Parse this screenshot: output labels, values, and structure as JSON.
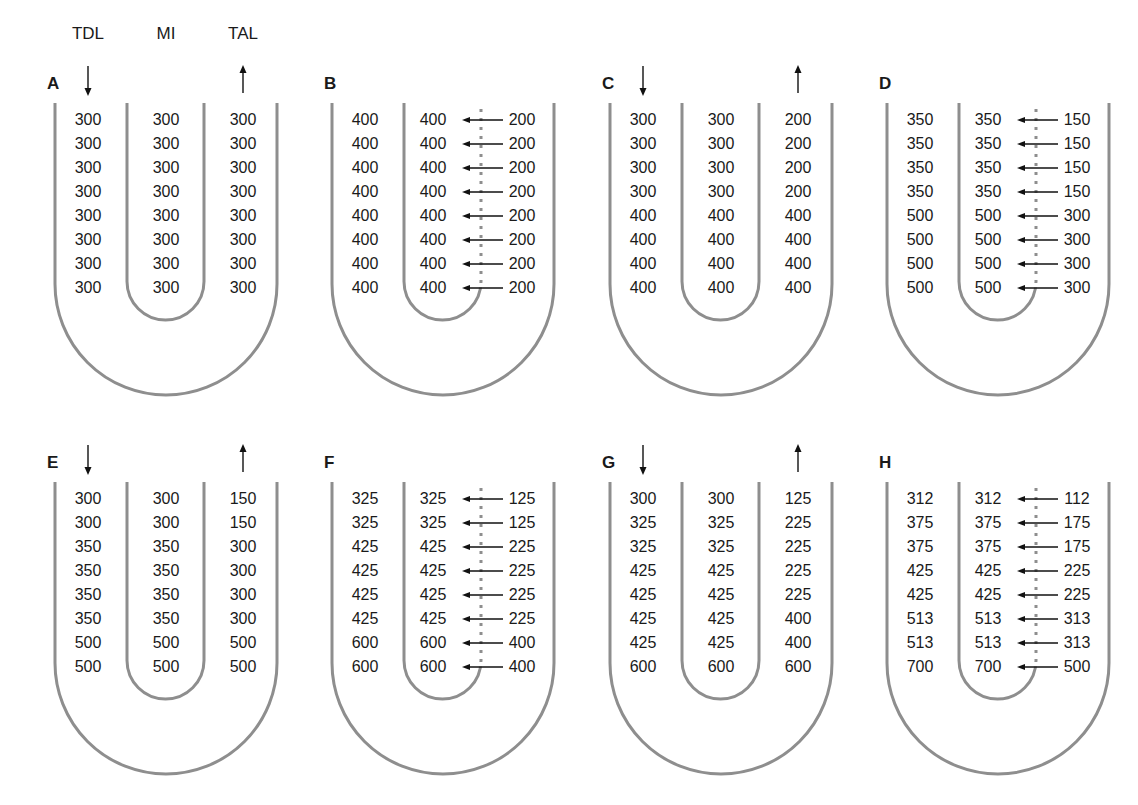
{
  "headers": {
    "left": "TDL",
    "middle": "MI",
    "right": "TAL"
  },
  "colors": {
    "tube": "#8e8e8e",
    "text": "#1a1a1a",
    "arrow": "#111111"
  },
  "panels": [
    {
      "label": "A",
      "flow_arrows": false,
      "transport": false,
      "rows": [
        [
          300,
          300,
          300
        ],
        [
          300,
          300,
          300
        ],
        [
          300,
          300,
          300
        ],
        [
          300,
          300,
          300
        ],
        [
          300,
          300,
          300
        ],
        [
          300,
          300,
          300
        ],
        [
          300,
          300,
          300
        ],
        [
          300,
          300,
          300
        ]
      ]
    },
    {
      "label": "B",
      "flow_arrows": false,
      "transport": true,
      "rows": [
        [
          400,
          400,
          200
        ],
        [
          400,
          400,
          200
        ],
        [
          400,
          400,
          200
        ],
        [
          400,
          400,
          200
        ],
        [
          400,
          400,
          200
        ],
        [
          400,
          400,
          200
        ],
        [
          400,
          400,
          200
        ],
        [
          400,
          400,
          200
        ]
      ]
    },
    {
      "label": "C",
      "flow_arrows": true,
      "transport": false,
      "rows": [
        [
          300,
          300,
          200
        ],
        [
          300,
          300,
          200
        ],
        [
          300,
          300,
          200
        ],
        [
          300,
          300,
          200
        ],
        [
          400,
          400,
          400
        ],
        [
          400,
          400,
          400
        ],
        [
          400,
          400,
          400
        ],
        [
          400,
          400,
          400
        ]
      ]
    },
    {
      "label": "D",
      "flow_arrows": false,
      "transport": true,
      "rows": [
        [
          350,
          350,
          150
        ],
        [
          350,
          350,
          150
        ],
        [
          350,
          350,
          150
        ],
        [
          350,
          350,
          150
        ],
        [
          500,
          500,
          300
        ],
        [
          500,
          500,
          300
        ],
        [
          500,
          500,
          300
        ],
        [
          500,
          500,
          300
        ]
      ]
    },
    {
      "label": "E",
      "flow_arrows": true,
      "transport": false,
      "rows": [
        [
          300,
          300,
          150
        ],
        [
          300,
          300,
          150
        ],
        [
          350,
          350,
          300
        ],
        [
          350,
          350,
          300
        ],
        [
          350,
          350,
          300
        ],
        [
          350,
          350,
          300
        ],
        [
          500,
          500,
          500
        ],
        [
          500,
          500,
          500
        ]
      ]
    },
    {
      "label": "F",
      "flow_arrows": false,
      "transport": true,
      "rows": [
        [
          325,
          325,
          125
        ],
        [
          325,
          325,
          125
        ],
        [
          425,
          425,
          225
        ],
        [
          425,
          425,
          225
        ],
        [
          425,
          425,
          225
        ],
        [
          425,
          425,
          225
        ],
        [
          600,
          600,
          400
        ],
        [
          600,
          600,
          400
        ]
      ]
    },
    {
      "label": "G",
      "flow_arrows": true,
      "transport": false,
      "rows": [
        [
          300,
          300,
          125
        ],
        [
          325,
          325,
          225
        ],
        [
          325,
          325,
          225
        ],
        [
          425,
          425,
          225
        ],
        [
          425,
          425,
          225
        ],
        [
          425,
          425,
          400
        ],
        [
          425,
          425,
          400
        ],
        [
          600,
          600,
          600
        ]
      ]
    },
    {
      "label": "H",
      "flow_arrows": false,
      "transport": true,
      "rows": [
        [
          312,
          312,
          112
        ],
        [
          375,
          375,
          175
        ],
        [
          375,
          375,
          175
        ],
        [
          425,
          425,
          225
        ],
        [
          425,
          425,
          225
        ],
        [
          513,
          513,
          313
        ],
        [
          513,
          513,
          313
        ],
        [
          700,
          700,
          500
        ]
      ]
    }
  ]
}
